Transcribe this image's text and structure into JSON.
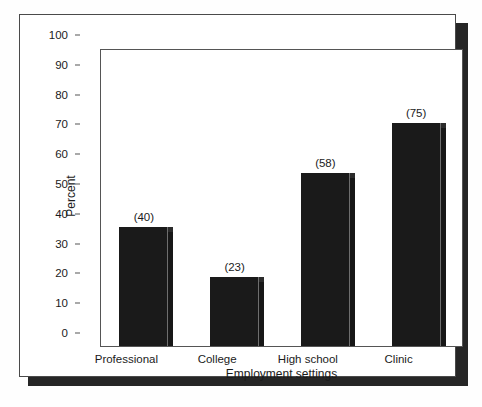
{
  "figure": {
    "frame_border_color": "#4a4a4a",
    "shadow_color": "#262626",
    "background_color": "#ffffff"
  },
  "chart_data": {
    "type": "bar",
    "title": "",
    "subtitle": "",
    "xlabel": "Employment settings",
    "ylabel": "Percent",
    "categories": [
      "Professional",
      "College",
      "High school",
      "Clinic"
    ],
    "values": [
      40,
      23,
      58,
      75
    ],
    "data_labels": [
      "(40)",
      "(23)",
      "(58)",
      "(75)"
    ],
    "ylim": [
      0,
      100
    ],
    "ytick_values": [
      0,
      10,
      20,
      30,
      40,
      50,
      60,
      70,
      80,
      90,
      100
    ],
    "ytick_labels": [
      "0",
      "10",
      "20",
      "30",
      "40",
      "50",
      "60",
      "70",
      "80",
      "90",
      "100"
    ],
    "grid": false,
    "legend": false,
    "legend_position": "none",
    "bar_color": "#1a1a1a",
    "bar_side_color": "#171717",
    "bar_style": "3d-extruded"
  }
}
